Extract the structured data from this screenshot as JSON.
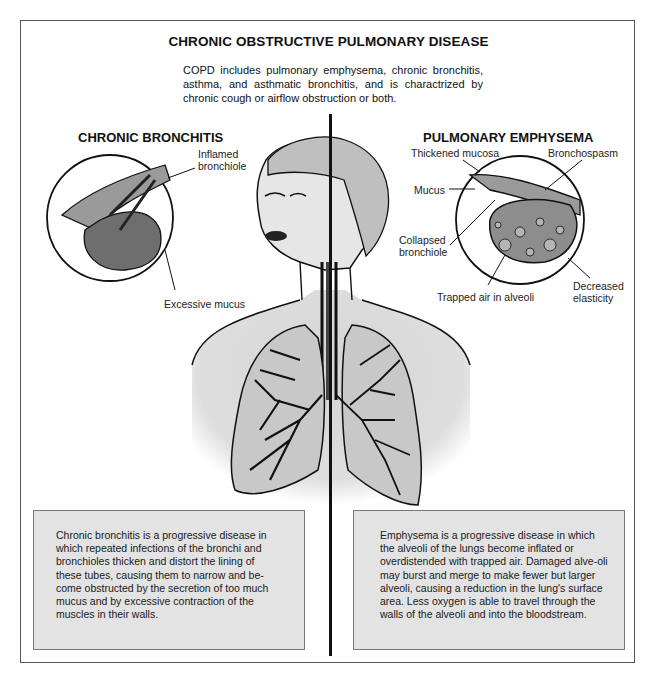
{
  "title": "CHRONIC OBSTRUCTIVE PULMONARY DISEASE",
  "intro": "COPD includes pulmonary emphysema, chronic bronchitis, asthma, and asthmatic bronchitis, and is charactrized by chronic cough or airflow obstruction or both.",
  "left": {
    "heading": "CHRONIC BRONCHITIS",
    "labels": {
      "inflamed_bronchiole_1": "Inflamed",
      "inflamed_bronchiole_2": "bronchiole",
      "excessive_mucus": "Excessive mucus"
    },
    "description": "Chronic bronchitis is a progressive disease in which repeated infections of the bronchi and bronchioles thicken and distort the lining of these tubes, causing them to narrow and be-come obstructed by the secretion of too much mucus and by excessive contraction of the muscles in their walls."
  },
  "right": {
    "heading": "PULMONARY EMPHYSEMA",
    "labels": {
      "thickened_mucosa": "Thickened mucosa",
      "bronchospasm": "Bronchospasm",
      "mucus": "Mucus",
      "collapsed_bronchiole_1": "Collapsed",
      "collapsed_bronchiole_2": "bronchiole",
      "decreased_elasticity_1": "Decreased",
      "decreased_elasticity_2": "elasticity",
      "trapped_air": "Trapped air in alveoli"
    },
    "description": "Emphysema is a progressive disease in which the alveoli of the lungs become inflated or overdistended with trapped air. Damaged alve-oli may burst and merge to make fewer but larger alveoli, causing a reduction in the lung's surface area. Less oxygen is able to travel through the walls of the alveoli and into the bloodstream."
  },
  "colors": {
    "lung_fill": "#c8c8c8",
    "box_fill": "#e3e3e3",
    "ink": "#111111"
  }
}
